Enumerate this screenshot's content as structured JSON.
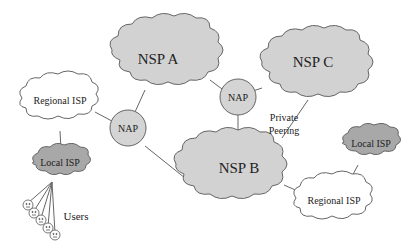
{
  "diagram": {
    "title": "",
    "colors": {
      "nsp_fill": "#d2d2d2",
      "local_isp_fill": "#a8a8a8",
      "regional_isp_fill": "#ffffff",
      "nap_fill": "#d4d4d4",
      "stroke": "#555555",
      "text": "#222222"
    },
    "nodes": [
      {
        "id": "nsp_a",
        "label": "NSP A",
        "type": "nsp-cloud"
      },
      {
        "id": "nsp_b",
        "label": "NSP B",
        "type": "nsp-cloud"
      },
      {
        "id": "nsp_c",
        "label": "NSP C",
        "type": "nsp-cloud"
      },
      {
        "id": "nap_left",
        "label": "NAP",
        "type": "nap-circle"
      },
      {
        "id": "nap_right",
        "label": "NAP",
        "type": "nap-circle"
      },
      {
        "id": "regional_isp_left",
        "label": "Regional ISP",
        "type": "regional-isp-cloud"
      },
      {
        "id": "regional_isp_right",
        "label": "Regional ISP",
        "type": "regional-isp-cloud"
      },
      {
        "id": "local_isp_left",
        "label": "Local ISP",
        "type": "local-isp-cloud"
      },
      {
        "id": "local_isp_right",
        "label": "Local ISP",
        "type": "local-isp-cloud"
      },
      {
        "id": "users",
        "label": "Users",
        "type": "user-group",
        "count": 5
      }
    ],
    "edges": [
      [
        "regional_isp_left",
        "nap_left"
      ],
      [
        "nap_left",
        "nsp_a"
      ],
      [
        "nap_left",
        "nsp_b"
      ],
      [
        "nsp_a",
        "nap_right"
      ],
      [
        "nap_right",
        "nsp_c"
      ],
      [
        "nap_right",
        "nsp_b"
      ],
      [
        "nsp_c",
        "nsp_b"
      ],
      [
        "regional_isp_left",
        "local_isp_left"
      ],
      [
        "local_isp_left",
        "users"
      ],
      [
        "nsp_b",
        "regional_isp_right"
      ],
      [
        "regional_isp_right",
        "local_isp_right"
      ]
    ],
    "annotations": [
      {
        "text_line1": "Private",
        "text_line2": "Peering",
        "edge": [
          "nsp_c",
          "nsp_b"
        ]
      }
    ]
  }
}
